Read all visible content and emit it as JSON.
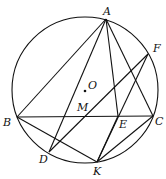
{
  "diagram": {
    "type": "geometry-circle",
    "circle": {
      "center": "O",
      "cx": 85,
      "cy": 90,
      "r": 73
    },
    "points": {
      "A": {
        "x": 106,
        "y": 19,
        "label": "A",
        "lx": 103,
        "ly": 15
      },
      "F": {
        "x": 148,
        "y": 54,
        "label": "F",
        "lx": 153,
        "ly": 52
      },
      "B": {
        "x": 17,
        "y": 117,
        "label": "B",
        "lx": 3,
        "ly": 126
      },
      "C": {
        "x": 153,
        "y": 116,
        "label": "C",
        "lx": 155,
        "ly": 125
      },
      "E": {
        "x": 118,
        "y": 116,
        "label": "E",
        "lx": 119,
        "ly": 128
      },
      "M": {
        "x": 83,
        "y": 116,
        "label": "M",
        "lx": 77,
        "ly": 111
      },
      "D": {
        "x": 49,
        "y": 152,
        "label": "D",
        "lx": 39,
        "ly": 163
      },
      "K": {
        "x": 97,
        "y": 162,
        "label": "K",
        "lx": 93,
        "ly": 175
      },
      "O": {
        "x": 85,
        "y": 91,
        "label": "O",
        "lx": 88,
        "ly": 89
      }
    },
    "segments": [
      [
        "A",
        "B"
      ],
      [
        "A",
        "D"
      ],
      [
        "A",
        "E"
      ],
      [
        "A",
        "C"
      ],
      [
        "B",
        "C"
      ],
      [
        "B",
        "K"
      ],
      [
        "E",
        "K"
      ],
      [
        "C",
        "K"
      ],
      [
        "D",
        "F"
      ],
      [
        "F",
        "K"
      ]
    ]
  }
}
